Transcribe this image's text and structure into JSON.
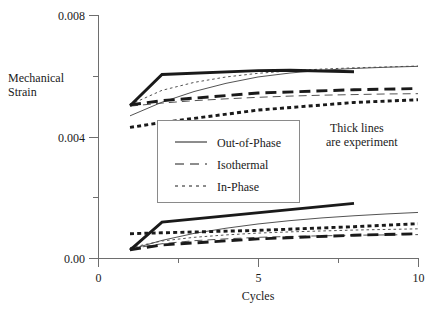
{
  "chart_data": {
    "type": "line",
    "title": "",
    "xlabel": "Cycles",
    "ylabel_line1": "Mechanical",
    "ylabel_line2": "Strain",
    "xlim": [
      0,
      10
    ],
    "ylim": [
      0.0,
      0.008
    ],
    "grid": false,
    "x_ticks_major": [
      0,
      5,
      10
    ],
    "x_tick_labels": [
      "0",
      "5",
      "10"
    ],
    "x_ticks_minor": [
      2.5,
      7.5
    ],
    "y_ticks_major": [
      0.0,
      0.004,
      0.008
    ],
    "y_tick_labels": [
      "0.00",
      "0.004",
      "0.008"
    ],
    "y_ticks_minor": [
      0.002,
      0.006
    ],
    "annotation_line1": "Thick lines",
    "annotation_line2": "are experiment",
    "legend": {
      "position": "center-left",
      "entries": [
        {
          "label": "Out-of-Phase",
          "style": "solid"
        },
        {
          "label": "Isothermal",
          "style": "dashed"
        },
        {
          "label": "In-Phase",
          "style": "dotted"
        }
      ]
    },
    "series": [
      {
        "name": "Out-of-Phase experiment (max strain)",
        "group": "upper",
        "style": "solid",
        "weight": "thick",
        "x": [
          1.0,
          2.0,
          5.0,
          6.0,
          8.0
        ],
        "values": [
          0.00501,
          0.00604,
          0.00617,
          0.00618,
          0.00613
        ]
      },
      {
        "name": "Out-of-Phase simulation (max strain)",
        "group": "upper",
        "style": "solid",
        "weight": "thin",
        "x": [
          1.0,
          2.0,
          3.0,
          4.0,
          5.0,
          6.0,
          7.0,
          8.0,
          9.0,
          10.0
        ],
        "values": [
          0.00468,
          0.00513,
          0.00548,
          0.00575,
          0.00596,
          0.00609,
          0.00618,
          0.00624,
          0.00628,
          0.00631
        ]
      },
      {
        "name": "In-Phase experiment (max strain)",
        "group": "upper",
        "style": "dotted",
        "weight": "thick",
        "x": [
          1.0,
          2.0,
          5.0,
          8.0,
          10.0
        ],
        "values": [
          0.0043,
          0.00446,
          0.00487,
          0.00512,
          0.00521
        ]
      },
      {
        "name": "In-Phase simulation (max strain)",
        "group": "upper",
        "style": "dotted",
        "weight": "thin",
        "x": [
          1.0,
          2.0,
          3.0,
          4.0,
          5.0,
          6.0,
          7.0,
          8.0,
          9.0,
          10.0
        ],
        "values": [
          0.00505,
          0.00552,
          0.00578,
          0.00596,
          0.00608,
          0.00616,
          0.00622,
          0.00626,
          0.00629,
          0.00632
        ]
      },
      {
        "name": "Isothermal experiment (max strain)",
        "group": "upper",
        "style": "dashed",
        "weight": "thick",
        "x": [
          1.0,
          2.0,
          5.0,
          8.0,
          10.0
        ],
        "values": [
          0.00504,
          0.00518,
          0.00543,
          0.00554,
          0.00558
        ]
      },
      {
        "name": "Isothermal simulation (max strain)",
        "group": "upper",
        "style": "dashed",
        "weight": "thin",
        "x": [
          1.0,
          2.0,
          3.0,
          4.0,
          5.0,
          6.0,
          7.0,
          8.0,
          9.0,
          10.0
        ],
        "values": [
          0.005,
          0.0051,
          0.00518,
          0.00524,
          0.00529,
          0.00533,
          0.00536,
          0.00538,
          0.0054,
          0.00541
        ]
      },
      {
        "name": "Out-of-Phase experiment (min strain)",
        "group": "lower",
        "style": "solid",
        "weight": "thick",
        "x": [
          1.0,
          2.0,
          8.0
        ],
        "values": [
          0.00026,
          0.00118,
          0.0018
        ]
      },
      {
        "name": "Out-of-Phase simulation (min strain)",
        "group": "lower",
        "style": "solid",
        "weight": "thin",
        "x": [
          1.0,
          2.0,
          3.0,
          4.0,
          5.0,
          6.0,
          7.0,
          8.0,
          9.0,
          10.0
        ],
        "values": [
          0.00028,
          0.00058,
          0.00081,
          0.00098,
          0.00112,
          0.00123,
          0.00132,
          0.00139,
          0.00145,
          0.0015
        ]
      },
      {
        "name": "In-Phase experiment (min strain)",
        "group": "lower",
        "style": "dotted",
        "weight": "thick",
        "x": [
          1.0,
          2.0,
          5.0,
          8.0,
          10.0
        ],
        "values": [
          0.0008,
          0.00083,
          0.00091,
          0.00103,
          0.00113
        ]
      },
      {
        "name": "In-Phase simulation (min strain)",
        "group": "lower",
        "style": "dotted",
        "weight": "thin",
        "x": [
          1.0,
          2.0,
          3.0,
          4.0,
          5.0,
          6.0,
          7.0,
          8.0,
          9.0,
          10.0
        ],
        "values": [
          0.00034,
          0.00056,
          0.00068,
          0.00076,
          0.00082,
          0.00086,
          0.00089,
          0.00092,
          0.00094,
          0.00096
        ]
      },
      {
        "name": "Isothermal experiment (min strain)",
        "group": "lower",
        "style": "dashed",
        "weight": "thick",
        "x": [
          1.0,
          2.0,
          5.0,
          8.0,
          10.0
        ],
        "values": [
          0.00027,
          0.00043,
          0.00063,
          0.00075,
          0.0008
        ]
      },
      {
        "name": "Isothermal simulation (min strain)",
        "group": "lower",
        "style": "dashed",
        "weight": "thin",
        "x": [
          1.0,
          2.0,
          3.0,
          4.0,
          5.0,
          6.0,
          7.0,
          8.0,
          9.0,
          10.0
        ],
        "values": [
          0.0003,
          0.00047,
          0.00057,
          0.00063,
          0.00068,
          0.00071,
          0.00073,
          0.00075,
          0.00076,
          0.00077
        ]
      }
    ]
  },
  "colors": {
    "ink": "#1a1a1a",
    "axis": "#6e6e6e",
    "thin_line": "#4a4a4a",
    "background": "#ffffff"
  },
  "geometry": {
    "plot_left": 98,
    "plot_right": 418,
    "plot_top": 15,
    "plot_bottom": 258,
    "legend_x": 157,
    "legend_y": 120,
    "legend_w": 142,
    "legend_h": 82,
    "note_x": 330,
    "note_y": 132
  }
}
